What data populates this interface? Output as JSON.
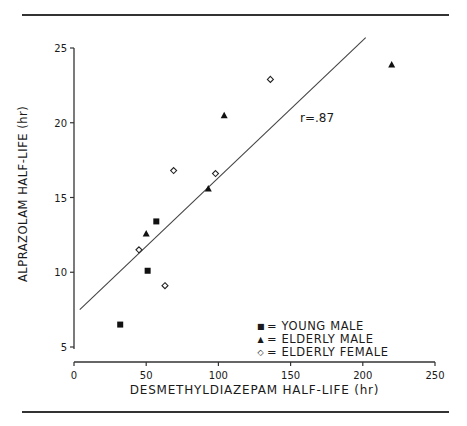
{
  "chart_data": {
    "type": "scatter",
    "title": "",
    "xlabel": "DESMETHYLDIAZEPAM HALF-LIFE (hr)",
    "ylabel": "ALPRAZOLAM HALF-LIFE (hr)",
    "xlim": [
      0,
      250
    ],
    "ylim": [
      5,
      25
    ],
    "x_ticks": [
      "0",
      "50",
      "100",
      "150",
      "200",
      "250"
    ],
    "y_ticks": [
      "5",
      "10",
      "15",
      "20",
      "25"
    ],
    "grid": false,
    "legend_position": "lower right",
    "series": [
      {
        "name": "YOUNG MALE",
        "marker": "filled-square",
        "points": [
          [
            32,
            6.5
          ],
          [
            51,
            10.1
          ],
          [
            57,
            13.4
          ]
        ]
      },
      {
        "name": "ELDERLY MALE",
        "marker": "filled-triangle",
        "points": [
          [
            50,
            12.6
          ],
          [
            93,
            15.6
          ],
          [
            104,
            20.5
          ],
          [
            220,
            23.9
          ]
        ]
      },
      {
        "name": "ELDERLY FEMALE",
        "marker": "open-diamond",
        "points": [
          [
            45,
            11.5
          ],
          [
            63,
            9.1
          ],
          [
            69,
            16.8
          ],
          [
            98,
            16.6
          ],
          [
            136,
            22.9
          ]
        ]
      }
    ],
    "regression_line": {
      "x": [
        4,
        202
      ],
      "y": [
        7.5,
        25.7
      ]
    },
    "annotations": [
      "r=.87"
    ]
  },
  "legend": {
    "items": [
      {
        "symbol": "■",
        "label": "= YOUNG MALE"
      },
      {
        "symbol": "▲",
        "label": "= ELDERLY MALE"
      },
      {
        "symbol": "◇",
        "label": "= ELDERLY FEMALE"
      }
    ]
  },
  "annotation": "r=.87"
}
